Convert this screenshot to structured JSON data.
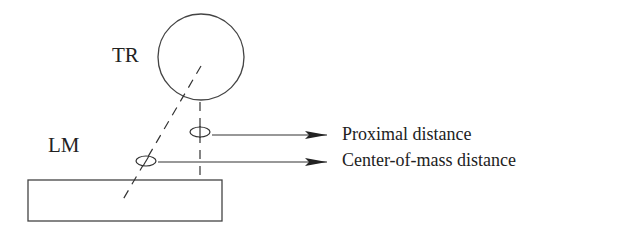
{
  "diagram": {
    "type": "spatial-relation-schematic",
    "colors": {
      "stroke": "#333333",
      "text": "#222222",
      "background": "#ffffff"
    },
    "labels": {
      "trajector": "TR",
      "landmark": "LM"
    },
    "annotations": [
      {
        "id": "proximal",
        "label": "Proximal distance"
      },
      {
        "id": "center_of_mass",
        "label": "Center-of-mass distance"
      }
    ],
    "shapes": {
      "trajector": {
        "shape": "circle",
        "cx": 201,
        "cy": 57,
        "r": 43
      },
      "landmark": {
        "shape": "rectangle",
        "x": 28,
        "y": 180,
        "width": 194,
        "height": 41
      }
    }
  }
}
